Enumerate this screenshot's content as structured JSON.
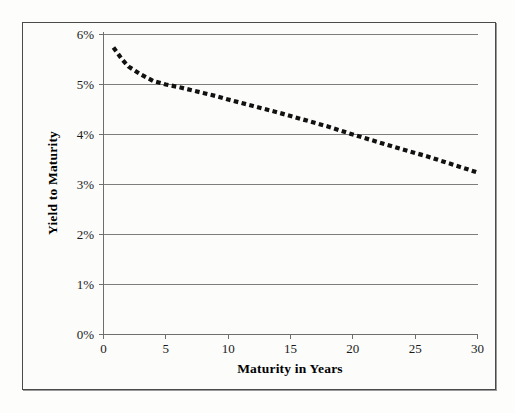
{
  "figure": {
    "frame_color": "#4a4a4a",
    "background_color": "#fcfcfb"
  },
  "chart_data": {
    "type": "line",
    "title": "",
    "subtitle": "",
    "xlabel": "Maturity in Years",
    "ylabel": "Yield to Maturity",
    "xlim": [
      0,
      30
    ],
    "ylim": [
      0,
      6
    ],
    "xticks": [
      0,
      5,
      10,
      15,
      20,
      25,
      30
    ],
    "xtick_labels": [
      "0",
      "5",
      "10",
      "15",
      "20",
      "25",
      "30"
    ],
    "yticks": [
      0,
      1,
      2,
      3,
      4,
      5,
      6
    ],
    "ytick_labels": [
      "0%",
      "1%",
      "2%",
      "3%",
      "4%",
      "5%",
      "6%"
    ],
    "grid": "horizontal",
    "legend": "none",
    "line_style": "dotted-thick",
    "line_color": "#111111",
    "series": [
      {
        "name": "Yield curve",
        "x": [
          0.8,
          1.5,
          2,
          3,
          4,
          5,
          6,
          7,
          8,
          9,
          10,
          12,
          14,
          16,
          18,
          20,
          22,
          24,
          26,
          28,
          30
        ],
        "y": [
          5.74,
          5.5,
          5.36,
          5.2,
          5.07,
          5.0,
          4.95,
          4.89,
          4.83,
          4.77,
          4.7,
          4.57,
          4.44,
          4.3,
          4.16,
          4.0,
          3.85,
          3.7,
          3.56,
          3.4,
          3.24
        ]
      }
    ],
    "annotations": []
  },
  "labels": {
    "y_axis_title": "Yield to Maturity",
    "x_axis_title": "Maturity in Years"
  }
}
